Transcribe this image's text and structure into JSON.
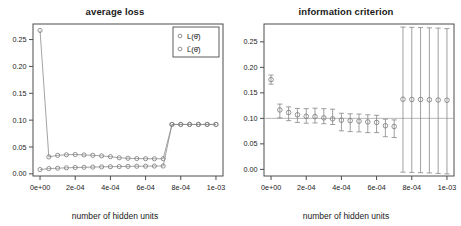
{
  "figure": {
    "background": "#ffffff",
    "axis_color": "#4d4d4d",
    "marker_color": "#808080",
    "line_color": "#8c8c8c",
    "refline_color": "#b0b0b0"
  },
  "panels": [
    {
      "id": "average-loss",
      "title": "average loss",
      "xlabel": "number of hidden units",
      "legend": {
        "entries": [
          {
            "marker": "circle-open",
            "label": "L(θ̂)"
          },
          {
            "marker": "circle-open",
            "label": "L̄(θ̂)"
          }
        ]
      }
    },
    {
      "id": "information-criterion",
      "title": "information criterion",
      "xlabel": "number of hidden units",
      "legend": null
    }
  ],
  "chart_data": [
    {
      "type": "line",
      "id": "average-loss",
      "title": "average loss",
      "xlabel": "number of hidden units",
      "ylabel": "",
      "xlim": [
        -4e-05,
        0.00104
      ],
      "ylim": [
        -0.004,
        0.279
      ],
      "xticks": [
        0,
        0.0002,
        0.0004,
        0.0006,
        0.0008,
        0.001
      ],
      "xticklabels": [
        "0e+00",
        "2e-04",
        "4e-04",
        "6e-04",
        "8e-04",
        "1e-03"
      ],
      "yticks": [
        0.0,
        0.05,
        0.1,
        0.15,
        0.2,
        0.25
      ],
      "yticklabels": [
        "0.00",
        "0.05",
        "0.10",
        "0.15",
        "0.20",
        "0.25"
      ],
      "grid": false,
      "legend_position": "top-right",
      "x": [
        0.0,
        5e-05,
        0.0001,
        0.00015,
        0.0002,
        0.00025,
        0.0003,
        0.00035,
        0.0004,
        0.00045,
        0.0005,
        0.00055,
        0.0006,
        0.00065,
        0.0007,
        0.00075,
        0.0008,
        0.00085,
        0.0009,
        0.00095,
        0.001
      ],
      "series": [
        {
          "name": "L(θ̂)",
          "marker": "circle-open",
          "values": [
            0.267,
            0.0315,
            0.0345,
            0.0355,
            0.036,
            0.0352,
            0.0345,
            0.0335,
            0.032,
            0.03,
            0.029,
            0.0285,
            0.0282,
            0.028,
            0.0282,
            0.092,
            0.092,
            0.092,
            0.092,
            0.092,
            0.092
          ]
        },
        {
          "name": "L̄(θ̂)",
          "marker": "circle-open",
          "values": [
            0.008,
            0.0098,
            0.0105,
            0.0112,
            0.0118,
            0.0122,
            0.0126,
            0.013,
            0.0133,
            0.0136,
            0.0139,
            0.0141,
            0.0143,
            0.0145,
            0.0146,
            0.092,
            0.092,
            0.092,
            0.092,
            0.092,
            0.092
          ]
        }
      ]
    },
    {
      "type": "scatter",
      "id": "information-criterion",
      "title": "information criterion",
      "xlabel": "number of hidden units",
      "ylabel": "",
      "xlim": [
        -4e-05,
        0.00104
      ],
      "ylim": [
        -0.013,
        0.285
      ],
      "xticks": [
        0,
        0.0002,
        0.0004,
        0.0006,
        0.0008,
        0.001
      ],
      "xticklabels": [
        "0e+00",
        "2e-04",
        "4e-04",
        "6e-04",
        "8e-04",
        "1e-03"
      ],
      "yticks": [
        0.0,
        0.05,
        0.1,
        0.15,
        0.2,
        0.25
      ],
      "yticklabels": [
        "0.00",
        "0.05",
        "0.10",
        "0.15",
        "0.20",
        "0.25"
      ],
      "grid": false,
      "reference_line_y": 0.1,
      "legend_position": "none",
      "x": [
        0.0,
        5e-05,
        0.0001,
        0.00015,
        0.0002,
        0.00025,
        0.0003,
        0.00035,
        0.0004,
        0.00045,
        0.0005,
        0.00055,
        0.0006,
        0.00065,
        0.0007,
        0.00075,
        0.0008,
        0.00085,
        0.0009,
        0.00095,
        0.001
      ],
      "mean": [
        0.176,
        0.1165,
        0.1115,
        0.107,
        0.104,
        0.1035,
        0.101,
        0.099,
        0.0965,
        0.0955,
        0.0945,
        0.093,
        0.092,
        0.0855,
        0.084,
        0.1375,
        0.137,
        0.137,
        0.1365,
        0.136,
        0.1355
      ],
      "error_low": [
        0.167,
        0.101,
        0.0955,
        0.092,
        0.0905,
        0.091,
        0.0895,
        0.088,
        0.0755,
        0.074,
        0.0735,
        0.072,
        0.072,
        0.064,
        0.0625,
        -0.0055,
        -0.006,
        -0.0065,
        -0.007,
        -0.008,
        -0.009
      ],
      "error_high": [
        0.185,
        0.128,
        0.1225,
        0.1195,
        0.119,
        0.12,
        0.119,
        0.118,
        0.11,
        0.109,
        0.1085,
        0.107,
        0.106,
        0.0985,
        0.097,
        0.279,
        0.2785,
        0.278,
        0.2775,
        0.277,
        0.276
      ]
    }
  ]
}
